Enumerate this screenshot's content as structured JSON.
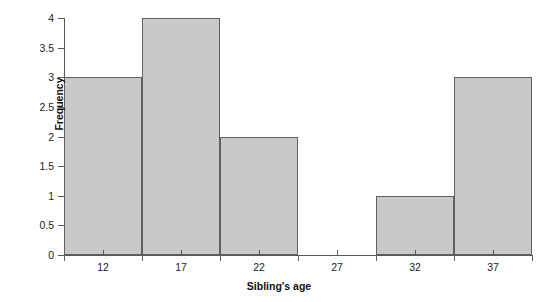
{
  "chart_data": {
    "type": "bar",
    "title": "",
    "subtitle": "",
    "xlabel": "Sibling's age",
    "ylabel": "Frequency",
    "categories": [
      "12",
      "17",
      "22",
      "27",
      "32",
      "37"
    ],
    "values": [
      3,
      4,
      2,
      0,
      1,
      3
    ],
    "bin_edges": [
      9.5,
      14.5,
      19.5,
      24.5,
      29.5,
      34.5,
      39.5
    ],
    "bin_width": 5,
    "x_tick_labels": [
      "12",
      "17",
      "22",
      "27",
      "32",
      "37"
    ],
    "y_tick_labels": [
      "0",
      "0.5",
      "1",
      "1.5",
      "2",
      "2.5",
      "3",
      "3.5",
      "4"
    ],
    "y_tick_values": [
      0,
      0.5,
      1,
      1.5,
      2,
      2.5,
      3,
      3.5,
      4
    ],
    "ylim": [
      0,
      4
    ],
    "grid": false,
    "legend": false,
    "legend_position": "none",
    "bar_fill_color": "#c9c9c9",
    "bar_edge_color": "#606060",
    "axis_color": "#595959",
    "background_color": "#ffffff",
    "text_color": "#1c1c1c"
  }
}
